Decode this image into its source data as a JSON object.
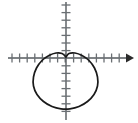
{
  "figure": {
    "title": "Cardioid curve on coordinate axes",
    "background_color": "#ffffff",
    "width": 138,
    "height": 123
  },
  "chart_data": {
    "type": "line",
    "title": "",
    "subtitle": "",
    "xlabel": "",
    "ylabel": "",
    "curve_name": "cardioid",
    "curve_equation": "r = a(1 - sin(theta))",
    "orientation": "cusp at origin pointing up, lobe opening downward",
    "curve_color": "#1a1a1a",
    "axis_color": "#555a5e",
    "tick_color": "#6a6f73",
    "grid": "off",
    "legend": "none",
    "origin_px": {
      "x": 66,
      "y": 58
    },
    "axes": {
      "x_axis": {
        "visible": true,
        "y_pixel": 58,
        "x_start_pixel": 8,
        "x_end_pixel": 133,
        "arrow_at_positive_end": true,
        "arrow_at_negative_end": false,
        "tick_spacing_px": 7.6,
        "tick_length_px": 9,
        "tick_positions_px": [
          12,
          20,
          27,
          35,
          43,
          50,
          58,
          66,
          74,
          81,
          89,
          97,
          104,
          112,
          120
        ],
        "tick_labels": []
      },
      "y_axis": {
        "visible": true,
        "x_pixel": 66,
        "y_start_pixel": 2,
        "y_end_pixel": 120,
        "arrow_at_positive_end": false,
        "arrow_at_negative_end": false,
        "tick_spacing_px": 7.6,
        "tick_length_px": 9,
        "tick_positions_px": [
          5,
          13,
          20,
          28,
          35,
          43,
          51,
          58,
          66,
          73,
          81,
          89,
          96,
          104,
          112
        ],
        "tick_labels": []
      }
    },
    "curve_extent_px": {
      "left": 33,
      "right": 99,
      "top": 56,
      "bottom": 109
    },
    "curve_points_px": [
      [
        66,
        57
      ],
      [
        62,
        53.5
      ],
      [
        56,
        53.0
      ],
      [
        49,
        55.5
      ],
      [
        42,
        60.5
      ],
      [
        36.5,
        68
      ],
      [
        33.5,
        77
      ],
      [
        33.5,
        86
      ],
      [
        37,
        94.5
      ],
      [
        43.5,
        101.5
      ],
      [
        52,
        106.5
      ],
      [
        61,
        108.8
      ],
      [
        70,
        108.8
      ],
      [
        79,
        106.5
      ],
      [
        87.5,
        101.5
      ],
      [
        94,
        94.5
      ],
      [
        97.5,
        86
      ],
      [
        97.5,
        77
      ],
      [
        94.5,
        68
      ],
      [
        89,
        60.5
      ],
      [
        82,
        55.5
      ],
      [
        75,
        53.0
      ],
      [
        69,
        53.5
      ],
      [
        66,
        57
      ]
    ]
  }
}
